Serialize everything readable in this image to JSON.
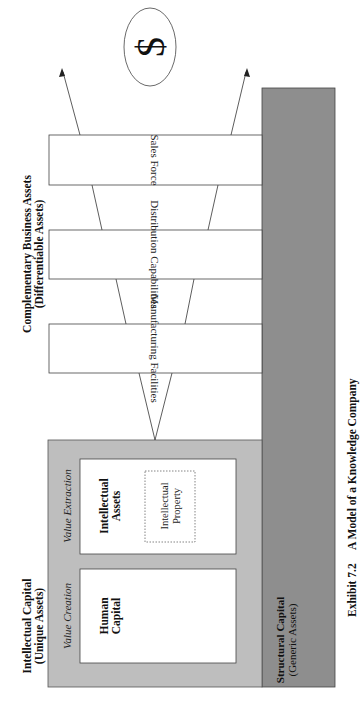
{
  "exhibit": {
    "number": "Exhibit 7.2",
    "title": "A Model of a Knowledge Company"
  },
  "intellectual_capital": {
    "title": "Intellectual Capital",
    "subtitle": "(Unique Assets)",
    "value_creation": {
      "label": "Value Creation",
      "box": "Human Capital",
      "box_line1": "Human",
      "box_line2": "Capital"
    },
    "value_extraction": {
      "label": "Value Extraction",
      "box": "Intellectual Assets",
      "box_line1": "Intellectual",
      "box_line2": "Assets",
      "inner_box_line1": "Intellectual",
      "inner_box_line2": "Property"
    }
  },
  "complementary_assets": {
    "title": "Complementary Business Assets",
    "subtitle": "(Differentiable Assets)",
    "items": [
      {
        "label": "Manufacturing Facilities"
      },
      {
        "label": "Distribution Capabilities"
      },
      {
        "label": "Sales Force"
      }
    ]
  },
  "structural_capital": {
    "title": "Structural Capital",
    "subtitle": "(Generic Assets)"
  },
  "outcome": {
    "symbol": "$",
    "icon": "dollar-icon"
  },
  "colors": {
    "structural_fill": "#8e8e8e",
    "intellectual_fill": "#bebebe",
    "box_fill": "#ffffff",
    "stroke": "#3a3a3a",
    "text": "#111111"
  }
}
